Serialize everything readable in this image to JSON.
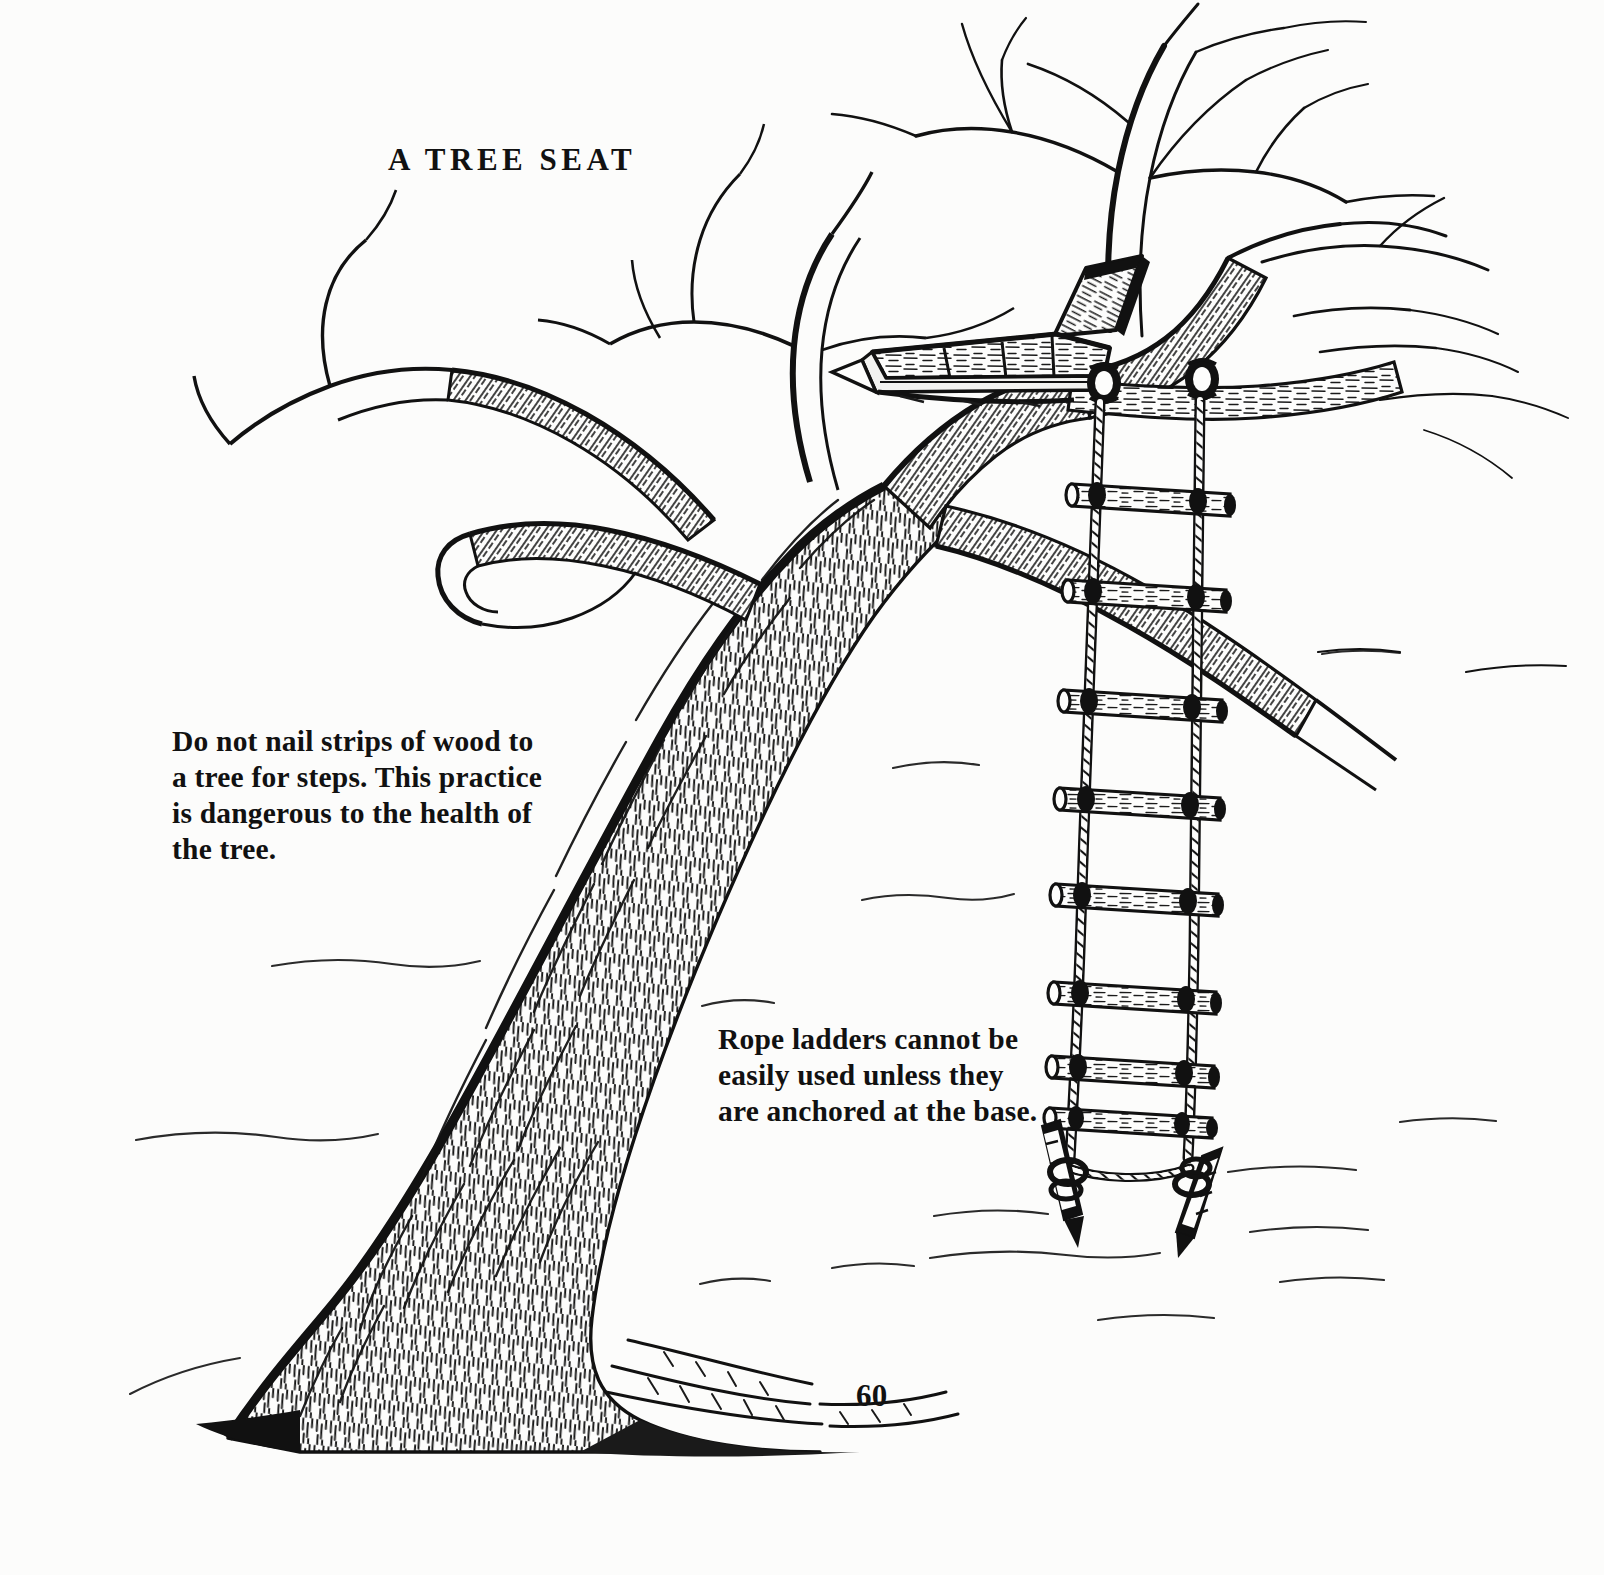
{
  "document": {
    "type": "illustration-page",
    "title": "A TREE SEAT",
    "page_number": "60",
    "paper_color": "#fcfcfb",
    "ink_color": "#111111"
  },
  "captions": {
    "left": {
      "name": "no-nail-warning",
      "text": "Do not nail strips of wood  to\na tree for steps. This practice\nis dangerous to the health of\nthe  tree."
    },
    "right": {
      "name": "rope-ladder-note",
      "text": "Rope  ladders  cannot be\neasily used  unless  they\nare anchored at the base."
    }
  },
  "illustration": {
    "subject": "A deciduous tree in winter with a plank seat built into the main fork and a rope ladder hanging from a branch, anchored to the ground with two stakes.",
    "elements": [
      {
        "name": "tree-trunk",
        "description": "Leaning trunk with dense vertical bark hatching, flared buttressed root base"
      },
      {
        "name": "tree-branches",
        "description": "Bare branching crown, thin tapering twigs, hatched shading on undersides"
      },
      {
        "name": "tree-seat",
        "description": "Wooden plank seat with angled back rest resting in the fork"
      },
      {
        "name": "rope-ladder",
        "description": "Two twisted ropes with eight wooden log rungs lashed between them"
      },
      {
        "name": "ground-stakes",
        "description": "Two angled stakes driven into ground anchoring the ladder ropes"
      },
      {
        "name": "ground-line",
        "description": "Light broken contour lines suggesting ground"
      }
    ],
    "rung_count": 8
  }
}
